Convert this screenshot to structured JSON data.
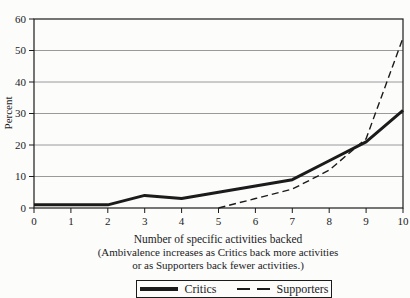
{
  "figure": {
    "background": "#fcfcfb"
  },
  "chart_data": {
    "type": "line",
    "title": "",
    "xlabel": "Number of specific activities backed",
    "xlabel_note_line1": "(Ambivalence increases as Critics back more activities",
    "xlabel_note_line2": "or as Supporters back fewer activities.)",
    "ylabel": "Percent",
    "xlim": [
      0,
      10
    ],
    "ylim": [
      0,
      60
    ],
    "x_ticks": [
      0,
      1,
      2,
      3,
      4,
      5,
      6,
      7,
      8,
      9,
      10
    ],
    "y_ticks": [
      0,
      10,
      20,
      30,
      40,
      50,
      60
    ],
    "grid": "horizontal-only",
    "legend_position": "bottom-center-boxed",
    "line_color": "#1b1b1b",
    "grid_color": "#8f8f8f",
    "series": [
      {
        "name": "Critics",
        "style": "solid",
        "stroke_width": 3,
        "x": [
          0,
          1,
          2,
          3,
          4,
          5,
          6,
          7,
          8,
          9,
          10
        ],
        "y": [
          1,
          1,
          1,
          4,
          3,
          5,
          7,
          9,
          15,
          21,
          31
        ]
      },
      {
        "name": "Supporters",
        "style": "dashed",
        "stroke_width": 1.4,
        "x": [
          5,
          6,
          7,
          8,
          9,
          10
        ],
        "y": [
          0,
          3,
          6,
          12,
          22,
          54
        ]
      }
    ]
  }
}
